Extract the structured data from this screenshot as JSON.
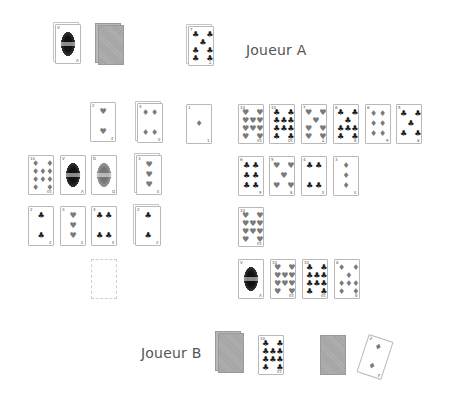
{
  "players": {
    "a": {
      "label": "Joueur A"
    },
    "b": {
      "label": "Joueur B"
    }
  },
  "suits": {
    "h": "♥",
    "d": "♦",
    "c": "♣",
    "s": "♠"
  },
  "colors": {
    "red_suit_gray": "#7a7a7a",
    "black_suit": "#1a1a1a",
    "card_back": "#a8a8a8",
    "text": "#555555"
  },
  "cards": [
    {
      "id": "a-face",
      "x": 55,
      "y": 24,
      "type": "face",
      "tone": "dark",
      "stack": true,
      "rank": "V",
      "suit": "c"
    },
    {
      "id": "a-deck",
      "x": 98,
      "y": 25,
      "type": "back",
      "stack": true
    },
    {
      "id": "a-play",
      "x": 188,
      "y": 26,
      "type": "pips",
      "rank": "7",
      "suit": "c",
      "count": 7,
      "stack": true
    },
    {
      "id": "l1-1",
      "x": 90,
      "y": 102,
      "type": "pips",
      "rank": "2",
      "suit": "h",
      "count": 2
    },
    {
      "id": "l1-2",
      "x": 137,
      "y": 103,
      "type": "pips",
      "rank": "4",
      "suit": "d",
      "count": 4,
      "stack": true
    },
    {
      "id": "l1-3",
      "x": 186,
      "y": 104,
      "type": "pips",
      "rank": "1",
      "suit": "d",
      "count": 1
    },
    {
      "id": "l2-1",
      "x": 28,
      "y": 155,
      "type": "pips",
      "rank": "10",
      "suit": "d",
      "count": 10
    },
    {
      "id": "l2-2",
      "x": 60,
      "y": 155,
      "type": "face",
      "tone": "dark",
      "rank": "V",
      "suit": "c"
    },
    {
      "id": "l2-3",
      "x": 91,
      "y": 155,
      "type": "face",
      "tone": "gray",
      "rank": "D",
      "suit": "h"
    },
    {
      "id": "l2-4",
      "x": 136,
      "y": 155,
      "type": "pips",
      "rank": "3",
      "suit": "h",
      "count": 3,
      "stack": true
    },
    {
      "id": "l3-1",
      "x": 28,
      "y": 206,
      "type": "pips",
      "rank": "2",
      "suit": "c",
      "count": 2
    },
    {
      "id": "l3-2",
      "x": 60,
      "y": 206,
      "type": "pips",
      "rank": "3",
      "suit": "h",
      "count": 3
    },
    {
      "id": "l3-3",
      "x": 91,
      "y": 206,
      "type": "pips",
      "rank": "4",
      "suit": "c",
      "count": 4
    },
    {
      "id": "l3-4",
      "x": 135,
      "y": 206,
      "type": "pips",
      "rank": "2",
      "suit": "c",
      "count": 2,
      "stack": true
    },
    {
      "id": "l4-slot",
      "x": 91,
      "y": 259,
      "type": "slot"
    },
    {
      "id": "r1-1",
      "x": 238,
      "y": 104,
      "type": "pips",
      "rank": "10",
      "suit": "h",
      "count": 10
    },
    {
      "id": "r1-2",
      "x": 269,
      "y": 104,
      "type": "pips",
      "rank": "10",
      "suit": "c",
      "count": 10
    },
    {
      "id": "r1-3",
      "x": 301,
      "y": 104,
      "type": "pips",
      "rank": "7",
      "suit": "h",
      "count": 7
    },
    {
      "id": "r1-4",
      "x": 333,
      "y": 104,
      "type": "pips",
      "rank": "8",
      "suit": "c",
      "count": 8
    },
    {
      "id": "r1-5",
      "x": 365,
      "y": 104,
      "type": "pips",
      "rank": "6",
      "suit": "d",
      "count": 6
    },
    {
      "id": "r1-6",
      "x": 396,
      "y": 104,
      "type": "pips",
      "rank": "5",
      "suit": "c",
      "count": 5
    },
    {
      "id": "r2-1",
      "x": 238,
      "y": 156,
      "type": "pips",
      "rank": "6",
      "suit": "c",
      "count": 6
    },
    {
      "id": "r2-2",
      "x": 269,
      "y": 156,
      "type": "pips",
      "rank": "5",
      "suit": "h",
      "count": 5
    },
    {
      "id": "r2-3",
      "x": 301,
      "y": 156,
      "type": "pips",
      "rank": "4",
      "suit": "c",
      "count": 4
    },
    {
      "id": "r2-4",
      "x": 333,
      "y": 156,
      "type": "pips",
      "rank": "3",
      "suit": "d",
      "count": 3
    },
    {
      "id": "r3-1",
      "x": 238,
      "y": 207,
      "type": "pips",
      "rank": "10",
      "suit": "h",
      "count": 10
    },
    {
      "id": "r4-1",
      "x": 238,
      "y": 259,
      "type": "face",
      "tone": "dark",
      "rank": "V",
      "suit": "c"
    },
    {
      "id": "r4-2",
      "x": 270,
      "y": 259,
      "type": "pips",
      "rank": "10",
      "suit": "h",
      "count": 10
    },
    {
      "id": "r4-3",
      "x": 302,
      "y": 259,
      "type": "pips",
      "rank": "10",
      "suit": "c",
      "count": 10
    },
    {
      "id": "r4-4",
      "x": 334,
      "y": 259,
      "type": "pips",
      "rank": "8",
      "suit": "d",
      "count": 8
    },
    {
      "id": "b-deck",
      "x": 218,
      "y": 333,
      "type": "back",
      "stack": true
    },
    {
      "id": "b-play",
      "x": 258,
      "y": 335,
      "type": "pips",
      "rank": "10",
      "suit": "c",
      "count": 10
    },
    {
      "id": "b-back",
      "x": 320,
      "y": 335,
      "type": "back"
    },
    {
      "id": "b-rot",
      "x": 362,
      "y": 337,
      "type": "pips",
      "rank": "2",
      "suit": "d",
      "count": 2,
      "rotated": true
    }
  ]
}
